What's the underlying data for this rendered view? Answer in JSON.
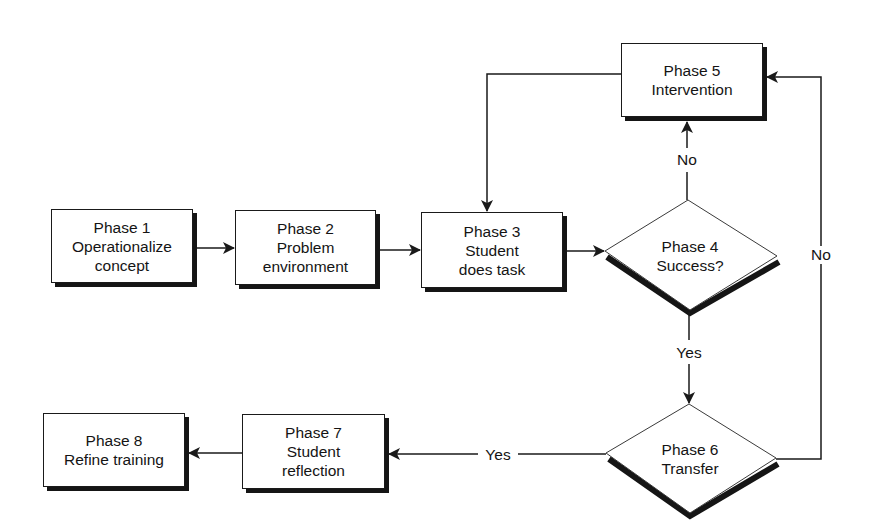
{
  "diagram": {
    "type": "flowchart",
    "nodes": [
      {
        "id": "phase1",
        "shape": "rect",
        "title": "Phase 1",
        "line2": "Operationalize",
        "line3": "concept"
      },
      {
        "id": "phase2",
        "shape": "rect",
        "title": "Phase 2",
        "line2": "Problem",
        "line3": "environment"
      },
      {
        "id": "phase3",
        "shape": "rect",
        "title": "Phase 3",
        "line2": "Student",
        "line3": "does task"
      },
      {
        "id": "phase4",
        "shape": "diamond",
        "title": "Phase 4",
        "line2": "Success?"
      },
      {
        "id": "phase5",
        "shape": "rect",
        "title": "Phase 5",
        "line2": "Intervention"
      },
      {
        "id": "phase6",
        "shape": "diamond",
        "title": "Phase 6",
        "line2": "Transfer"
      },
      {
        "id": "phase7",
        "shape": "rect",
        "title": "Phase 7",
        "line2": "Student",
        "line3": "reflection"
      },
      {
        "id": "phase8",
        "shape": "rect",
        "title": "Phase 8",
        "line2": "Refine training"
      }
    ],
    "edges": [
      {
        "from": "phase1",
        "to": "phase2",
        "label": ""
      },
      {
        "from": "phase2",
        "to": "phase3",
        "label": ""
      },
      {
        "from": "phase3",
        "to": "phase4",
        "label": ""
      },
      {
        "from": "phase4",
        "to": "phase5",
        "label": "No"
      },
      {
        "from": "phase5",
        "to": "phase3",
        "label": ""
      },
      {
        "from": "phase4",
        "to": "phase6",
        "label": "Yes"
      },
      {
        "from": "phase6",
        "to": "phase5",
        "label": "No"
      },
      {
        "from": "phase6",
        "to": "phase7",
        "label": "Yes"
      },
      {
        "from": "phase7",
        "to": "phase8",
        "label": ""
      }
    ],
    "edge_labels": {
      "p4_no": "No",
      "p4_yes": "Yes",
      "p6_no": "No",
      "p6_yes": "Yes"
    },
    "colors": {
      "line": "#1a1a1a",
      "shadow": "#151515",
      "background": "#ffffff"
    }
  }
}
